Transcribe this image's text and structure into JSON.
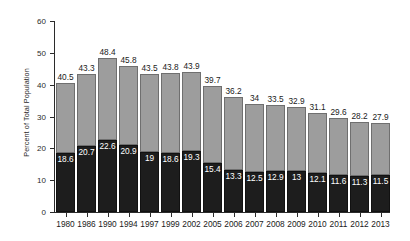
{
  "chart_data": {
    "type": "bar",
    "stacked": true,
    "title": "",
    "xlabel": "",
    "ylabel": "Percent of Total Population",
    "ylim": [
      0,
      60
    ],
    "yticks": [
      0,
      10,
      20,
      30,
      40,
      50,
      60
    ],
    "grid": false,
    "legend": "none",
    "categories": [
      "1980",
      "1986",
      "1990",
      "1994",
      "1997",
      "1999",
      "2002",
      "2005",
      "2006",
      "2007",
      "2008",
      "2009",
      "2010",
      "2011",
      "2012",
      "2013"
    ],
    "series": [
      {
        "name": "lower-segment",
        "color": "#1d1d1d",
        "values": [
          18.6,
          20.7,
          22.6,
          20.9,
          19,
          18.6,
          19.3,
          15.4,
          13.3,
          12.5,
          12.9,
          13,
          12.1,
          11.6,
          11.3,
          11.5
        ],
        "labels": [
          "18.6",
          "20.7",
          "22.6",
          "20.9",
          "19",
          "18.6",
          "19.3",
          "15.4",
          "13.3",
          "12.5",
          "12.9",
          "13",
          "12.1",
          "11.6",
          "11.3",
          "11.5"
        ]
      },
      {
        "name": "upper-segment",
        "color": "#9d9d9d",
        "values": [
          21.9,
          22.6,
          25.8,
          24.9,
          24.5,
          25.2,
          24.6,
          24.3,
          22.9,
          21.5,
          20.6,
          19.9,
          19.0,
          18.0,
          16.9,
          16.4
        ]
      }
    ],
    "totals": [
      40.5,
      43.3,
      48.4,
      45.8,
      43.5,
      43.8,
      43.9,
      39.7,
      36.2,
      34,
      33.5,
      32.9,
      31.1,
      29.6,
      28.2,
      27.9
    ],
    "total_labels": [
      "40.5",
      "43.3",
      "48.4",
      "45.8",
      "43.5",
      "43.8",
      "43.9",
      "39.7",
      "36.2",
      "34",
      "33.5",
      "32.9",
      "31.1",
      "29.6",
      "28.2",
      "27.9"
    ],
    "ytick_labels": [
      "0",
      "10",
      "20",
      "30",
      "40",
      "50",
      "60"
    ],
    "colors": {
      "lower": "#1d1d1d",
      "upper": "#9d9d9d",
      "axis": "#2b2b2b",
      "text": "#1a1a1a",
      "inner_text": "#ffffff",
      "background": "#ffffff"
    }
  }
}
